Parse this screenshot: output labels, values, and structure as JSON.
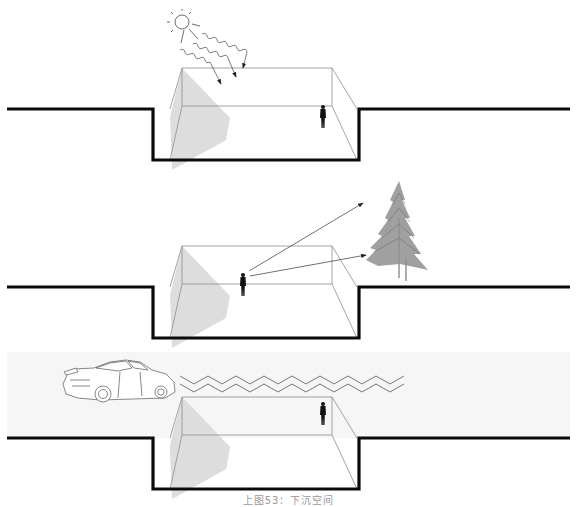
{
  "figure": {
    "caption": "上图53：下沉空间",
    "colors": {
      "ground_line": "#0a0a0a",
      "edge_line": "#8c8c8c",
      "shadow": "#dcdcdc",
      "band_bg": "#f7f7f7",
      "arrow": "#333333",
      "tree": "#8a8a8a"
    },
    "panels": [
      {
        "id": "sunlight",
        "label": "sun-rays-into-sunken-space",
        "elements": [
          "sun-icon",
          "wavy-arrows",
          "sunken-pit",
          "person-figure"
        ]
      },
      {
        "id": "view",
        "label": "view-out-to-tree",
        "elements": [
          "person-figure",
          "sight-arrows",
          "sunken-pit",
          "tree-icon"
        ]
      },
      {
        "id": "noise",
        "label": "noise-buffer-from-traffic",
        "elements": [
          "car-icon",
          "zigzag-noise-waves",
          "sunken-pit",
          "person-figure"
        ]
      }
    ]
  }
}
